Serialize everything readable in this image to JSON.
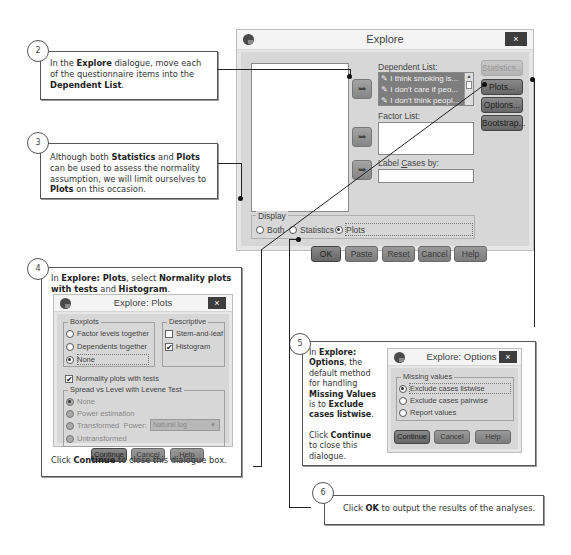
{
  "callouts": [
    {
      "number": "2",
      "parts": [
        {
          "t": "In the ",
          "b": false
        },
        {
          "t": "Explore",
          "b": true
        },
        {
          "t": " dialogue, move each of the questionnaire items into the ",
          "b": false
        },
        {
          "t": "Dependent List",
          "b": true
        },
        {
          "t": ".",
          "b": false
        }
      ]
    },
    {
      "number": "3",
      "parts": [
        {
          "t": "Although both ",
          "b": false
        },
        {
          "t": "Statistics",
          "b": true
        },
        {
          "t": " and ",
          "b": false
        },
        {
          "t": "Plots",
          "b": true
        },
        {
          "t": " can be used to assess the normality assumption, we will limit ourselves to ",
          "b": false
        },
        {
          "t": "Plots",
          "b": true
        },
        {
          "t": " on this occasion.",
          "b": false
        }
      ]
    },
    {
      "number": "4",
      "parts": [
        {
          "t": "In ",
          "b": false
        },
        {
          "t": "Explore: Plots",
          "b": true
        },
        {
          "t": ", select ",
          "b": false
        },
        {
          "t": "Normality plots with tests",
          "b": true
        },
        {
          "t": " and ",
          "b": false
        },
        {
          "t": "Histogram",
          "b": true
        },
        {
          "t": ".",
          "b": false
        }
      ],
      "footer_parts": [
        {
          "t": "Click ",
          "b": false
        },
        {
          "t": "Continue",
          "b": true
        },
        {
          "t": " to close this dialogue box.",
          "b": false
        }
      ]
    },
    {
      "number": "5",
      "parts": [
        {
          "t": "In ",
          "b": false
        },
        {
          "t": "Explore: Options",
          "b": true
        },
        {
          "t": ", the default method for handling ",
          "b": false
        },
        {
          "t": "Missing Values",
          "b": true
        },
        {
          "t": " is to ",
          "b": false
        },
        {
          "t": "Exclude cases listwise",
          "b": true
        },
        {
          "t": ".",
          "b": false
        }
      ],
      "footer_parts": [
        {
          "t": "Click ",
          "b": false
        },
        {
          "t": "Continue",
          "b": true
        },
        {
          "t": " to close this dialogue.",
          "b": false
        }
      ]
    },
    {
      "number": "6",
      "parts": [
        {
          "t": "Click ",
          "b": false
        },
        {
          "t": "OK",
          "b": true
        },
        {
          "t": " to output the results of the analyses.",
          "b": false
        }
      ]
    }
  ],
  "explore": {
    "title": "Explore",
    "close": "×",
    "dependent_list_label": "Dependent List:",
    "dependent_items": [
      "I think smoking is...",
      "I don't care if peo...",
      "I don't think peopl..."
    ],
    "factor_list_label": "Factor List:",
    "label_cases_label": "Label Cases by:",
    "side_buttons": [
      "Statistics...",
      "Plots...",
      "Options...",
      "Bootstrap..."
    ],
    "display_group": "Display",
    "display_options": [
      "Both",
      "Statistics",
      "Plots"
    ],
    "display_selected": "Plots",
    "bottom_buttons": [
      "OK",
      "Paste",
      "Reset",
      "Cancel",
      "Help"
    ],
    "arrow_glyph": "➥"
  },
  "plots": {
    "title": "Explore: Plots",
    "close": "×",
    "boxplots_group": "Boxplots",
    "boxplots_options": [
      "Factor levels together",
      "Dependents together",
      "None"
    ],
    "boxplots_selected": "None",
    "descriptive_group": "Descriptive",
    "descriptive_options": [
      {
        "label": "Stem-and-leaf",
        "checked": false
      },
      {
        "label": "Histogram",
        "checked": true
      }
    ],
    "normality_label": "Normality plots with tests",
    "normality_checked": true,
    "spread_group": "Spread vs Level with Levene Test",
    "spread_options": [
      "None",
      "Power estimation",
      "Transformed",
      "Untransformed"
    ],
    "spread_selected": "None",
    "power_label": "Power:",
    "power_value": "Natural log",
    "buttons": [
      "Continue",
      "Cancel",
      "Help"
    ]
  },
  "options": {
    "title": "Explore: Options",
    "close": "×",
    "missing_group": "Missing values",
    "missing_options": [
      "Exclude cases listwise",
      "Exclude cases pairwise",
      "Report values"
    ],
    "missing_selected": "Exclude cases listwise",
    "buttons": [
      "Continue",
      "Cancel",
      "Help"
    ]
  },
  "check_glyph": "✔"
}
